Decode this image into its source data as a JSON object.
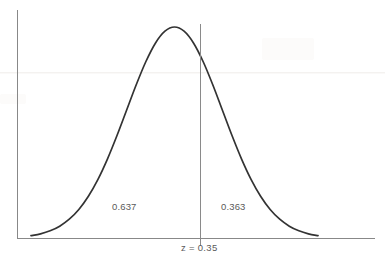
{
  "chart_data": {
    "type": "area",
    "title": "",
    "subtitle": "",
    "xlabel": "",
    "ylabel": "",
    "grid": false,
    "legend": null,
    "distribution": "standard normal",
    "mean": 0,
    "sd": 1,
    "cutoff_z": 0.35,
    "axis": {
      "x_axis_visible": true,
      "y_axis_visible": true,
      "x_tick_labels": [
        "z = 0.35"
      ],
      "y_tick_labels": []
    },
    "annotations": [
      {
        "name": "left-area-probability",
        "text": "0.637",
        "value": 0.637,
        "region": "left of z = 0.35"
      },
      {
        "name": "right-area-probability",
        "text": "0.363",
        "value": 0.363,
        "region": "right of z = 0.35"
      },
      {
        "name": "cutoff-label",
        "text": "z = 0.35",
        "value": 0.35,
        "region": "x-axis"
      }
    ],
    "series": [
      {
        "name": "normal density curve",
        "x": [
          -3.0,
          -2.8,
          -2.6,
          -2.4,
          -2.2,
          -2.0,
          -1.8,
          -1.6,
          -1.4,
          -1.2,
          -1.0,
          -0.8,
          -0.6,
          -0.4,
          -0.2,
          0.0,
          0.2,
          0.4,
          0.6,
          0.8,
          1.0,
          1.2,
          1.4,
          1.6,
          1.8,
          2.0,
          2.2,
          2.4,
          2.6,
          2.8,
          3.0
        ],
        "values": [
          0.0044,
          0.0079,
          0.0136,
          0.0224,
          0.0355,
          0.054,
          0.079,
          0.1109,
          0.1497,
          0.1942,
          0.242,
          0.2897,
          0.3332,
          0.3683,
          0.391,
          0.3989,
          0.391,
          0.3683,
          0.3332,
          0.2897,
          0.242,
          0.1942,
          0.1497,
          0.1109,
          0.079,
          0.054,
          0.0355,
          0.0224,
          0.0136,
          0.0079,
          0.0044
        ]
      }
    ],
    "xlim": [
      -3.0,
      3.0
    ],
    "ylim": [
      0,
      0.4
    ]
  },
  "figure": {
    "left_area_label": "0.637",
    "right_area_label": "0.363",
    "cutoff_label": "z = 0.35",
    "colors": {
      "curve": "#333333",
      "axis": "#888888",
      "divider": "#8a8a8a",
      "text": "#5a5a5a",
      "background": "#ffffff"
    }
  }
}
